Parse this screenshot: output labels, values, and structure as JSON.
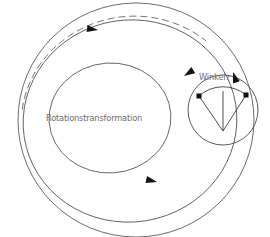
{
  "figure": {
    "title_label": "Rotationstransformation",
    "angle_label": "Winkel",
    "angle_symbol": "r",
    "colors": {
      "stroke": "#5a5a5a",
      "stroke_dark": "#3c3c3c",
      "marker": "#1a1a1a",
      "text": "#6d6d6d",
      "background": "#ffffff"
    },
    "geometry": {
      "outer_circle": {
        "cx": 136,
        "cy": 120,
        "r": 118,
        "dashed": false
      },
      "middle_ellipse": {
        "cx": 130,
        "cy": 120,
        "rx": 106,
        "ry": 102,
        "rotation": -8
      },
      "dashed_arc": {
        "cx": 133,
        "cy": 121,
        "rx": 112,
        "ry": 106,
        "rotation": -10,
        "dashed": true
      },
      "inner_ellipse": {
        "cx": 110,
        "cy": 118,
        "rx": 61,
        "ry": 55,
        "rotation": -4
      },
      "small_circle": {
        "cx": 223,
        "cy": 110,
        "r": 35
      },
      "sector": {
        "apex_x": 223,
        "apex_y": 131,
        "left_point_x": 199,
        "left_point_y": 96,
        "right_point_x": 246,
        "right_point_y": 95,
        "mid_line_end_x": 223,
        "mid_line_end_y": 91
      }
    },
    "arrows": [
      {
        "name": "arrow-outer-top",
        "x": 103,
        "y": 29,
        "angle": 196
      },
      {
        "name": "arrow-outer-right",
        "x": 232,
        "y": 70,
        "angle": 70
      },
      {
        "name": "arrow-middle-right",
        "x": 182,
        "y": 78,
        "angle": 330
      },
      {
        "name": "arrow-middle-bottom",
        "x": 162,
        "y": 181,
        "angle": 196
      }
    ],
    "markers": [
      {
        "name": "sector-endpoint-left",
        "x": 199,
        "y": 96
      },
      {
        "name": "sector-endpoint-right",
        "x": 246,
        "y": 95
      }
    ]
  }
}
